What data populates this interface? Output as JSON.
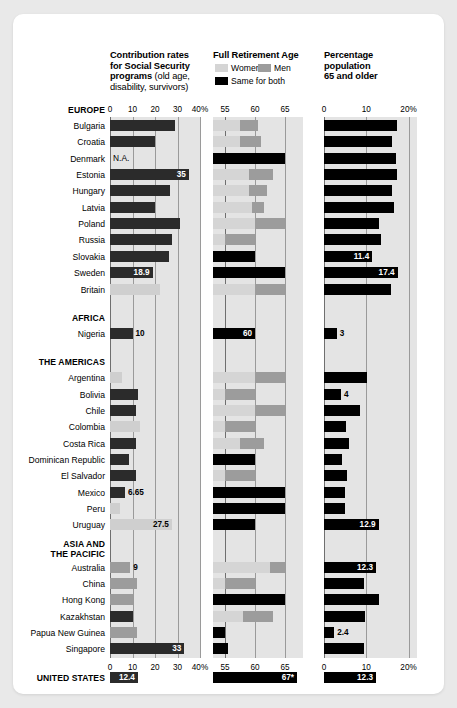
{
  "chart_data": {
    "type": "bar",
    "panels": [
      {
        "key": "contrib",
        "title_bold": "Contribution rates for Social Security programs",
        "title_light": " (old age, disability, survivors)",
        "xlabel": "",
        "ylabel": "",
        "xlim": [
          0,
          40
        ],
        "ticks": [
          "0",
          "10",
          "20",
          "30",
          "40%"
        ],
        "tickvals": [
          0,
          10,
          20,
          30,
          40
        ],
        "grid": true
      },
      {
        "key": "retirement",
        "title_bold": "Full Retirement Age",
        "title_light": "",
        "xlim": [
          53,
          68
        ],
        "ticks": [
          "55",
          "60",
          "65"
        ],
        "tickvals": [
          55,
          60,
          65
        ],
        "grid": true,
        "legend": [
          {
            "name": "Women",
            "color": "#d5d5d5"
          },
          {
            "name": "Men",
            "color": "#9c9c9c"
          },
          {
            "name": "Same for both",
            "color": "#000000"
          }
        ]
      },
      {
        "key": "pop65",
        "title_bold": "Percentage population 65 and older",
        "title_light": "",
        "xlim": [
          0,
          22
        ],
        "ticks": [
          "0",
          "10",
          "20%"
        ],
        "tickvals": [
          0,
          10,
          20
        ],
        "grid": true
      }
    ],
    "regions": [
      {
        "name": "EUROPE",
        "lines": [
          "EUROPE"
        ]
      },
      {
        "name": "AFRICA",
        "lines": [
          "AFRICA"
        ]
      },
      {
        "name": "THE AMERICAS",
        "lines": [
          "THE AMERICAS"
        ]
      },
      {
        "name": "ASIA AND THE PACIFIC",
        "lines": [
          "ASIA AND",
          "THE PACIFIC"
        ]
      },
      {
        "name": "UNITED STATES",
        "lines": [
          "UNITED STATES"
        ]
      }
    ],
    "rows": [
      {
        "label": "Bulgaria",
        "region": "EUROPE",
        "contrib": 29,
        "contrib_label": "",
        "na": false,
        "ret": {
          "mode": "split",
          "women": 57.5,
          "men": 60.5
        },
        "pop65": 17.3,
        "pop65_label": ""
      },
      {
        "label": "Croatia",
        "region": "EUROPE",
        "contrib": 20,
        "contrib_label": "",
        "na": false,
        "ret": {
          "mode": "split",
          "women": 57.5,
          "men": 61.0
        },
        "pop65": 16.0,
        "pop65_label": ""
      },
      {
        "label": "Denmark",
        "region": "EUROPE",
        "contrib": null,
        "contrib_label": "N.A.",
        "na": true,
        "ret": {
          "mode": "both",
          "age": 65.0
        },
        "pop65": 17.0,
        "pop65_label": ""
      },
      {
        "label": "Estonia",
        "region": "EUROPE",
        "contrib": 35,
        "contrib_label": "35",
        "na": false,
        "ret": {
          "mode": "split",
          "women": 59.0,
          "men": 63.0
        },
        "pop65": 17.2,
        "pop65_label": ""
      },
      {
        "label": "Hungary",
        "region": "EUROPE",
        "contrib": 26.5,
        "contrib_label": "",
        "na": false,
        "ret": {
          "mode": "split",
          "women": 59.0,
          "men": 62.0
        },
        "pop65": 16.0,
        "pop65_label": ""
      },
      {
        "label": "Latvia",
        "region": "EUROPE",
        "contrib": 20,
        "contrib_label": "",
        "na": false,
        "ret": {
          "mode": "split",
          "women": 59.5,
          "men": 61.5
        },
        "pop65": 16.6,
        "pop65_label": ""
      },
      {
        "label": "Poland",
        "region": "EUROPE",
        "contrib": 31,
        "contrib_label": "",
        "na": false,
        "ret": {
          "mode": "split",
          "women": 60.0,
          "men": 65.0
        },
        "pop65": 13.0,
        "pop65_label": ""
      },
      {
        "label": "Russia",
        "region": "EUROPE",
        "contrib": 27.5,
        "contrib_label": "",
        "na": false,
        "ret": {
          "mode": "split",
          "women": 55.0,
          "men": 60.0
        },
        "pop65": 13.4,
        "pop65_label": ""
      },
      {
        "label": "Slovakia",
        "region": "EUROPE",
        "contrib": 26,
        "contrib_label": "",
        "na": false,
        "ret": {
          "mode": "both",
          "age": 60.0
        },
        "pop65": 11.4,
        "pop65_label": "11.4"
      },
      {
        "label": "Sweden",
        "region": "EUROPE",
        "contrib": 18.9,
        "contrib_label": "18.9",
        "na": false,
        "ret": {
          "mode": "both",
          "age": 65.0
        },
        "pop65": 17.4,
        "pop65_label": "17.4"
      },
      {
        "label": "Britain",
        "region": "EUROPE",
        "contrib": 22,
        "contrib_label": "",
        "na": false,
        "light": true,
        "ret": {
          "mode": "split",
          "women": 60.0,
          "men": 65.0
        },
        "pop65": 15.8,
        "pop65_label": ""
      },
      {
        "label": "Nigeria",
        "region": "AFRICA",
        "contrib": 10,
        "contrib_label": "10",
        "na": false,
        "ret": {
          "mode": "both",
          "age": 60.0
        },
        "pop65": 3.0,
        "pop65_label": "3"
      },
      {
        "label": "Argentina",
        "region": "THE AMERICAS",
        "contrib": 5.5,
        "contrib_label": "",
        "na": false,
        "light": true,
        "ret": {
          "mode": "split",
          "women": 60.0,
          "men": 65.0
        },
        "pop65": 10.2,
        "pop65_label": ""
      },
      {
        "label": "Bolivia",
        "region": "THE AMERICAS",
        "contrib": 12.5,
        "contrib_label": "",
        "na": false,
        "ret": {
          "mode": "split",
          "women": 55.0,
          "men": 60.0
        },
        "pop65": 4.0,
        "pop65_label": "4"
      },
      {
        "label": "Chile",
        "region": "THE AMERICAS",
        "contrib": 11.5,
        "contrib_label": "",
        "na": false,
        "ret": {
          "mode": "split",
          "women": 60.0,
          "men": 65.0
        },
        "pop65": 8.5,
        "pop65_label": ""
      },
      {
        "label": "Colombia",
        "region": "THE AMERICAS",
        "contrib": 13.5,
        "contrib_label": "",
        "na": false,
        "light": true,
        "ret": {
          "mode": "split",
          "women": 55.0,
          "men": 60.0
        },
        "pop65": 5.2,
        "pop65_label": ""
      },
      {
        "label": "Costa Rica",
        "region": "THE AMERICAS",
        "contrib": 11.5,
        "contrib_label": "",
        "na": false,
        "ret": {
          "mode": "split",
          "women": 57.5,
          "men": 61.5
        },
        "pop65": 5.8,
        "pop65_label": ""
      },
      {
        "label": "Dominican Republic",
        "region": "THE AMERICAS",
        "contrib": 8.5,
        "contrib_label": "",
        "na": false,
        "ret": {
          "mode": "both",
          "age": 60.0
        },
        "pop65": 4.3,
        "pop65_label": ""
      },
      {
        "label": "El Salvador",
        "region": "THE AMERICAS",
        "contrib": 11.5,
        "contrib_label": "",
        "na": false,
        "ret": {
          "mode": "split",
          "women": 55.0,
          "men": 60.0
        },
        "pop65": 5.5,
        "pop65_label": ""
      },
      {
        "label": "Mexico",
        "region": "THE AMERICAS",
        "contrib": 6.65,
        "contrib_label": "6.65",
        "na": false,
        "ret": {
          "mode": "both",
          "age": 65.0
        },
        "pop65": 5.0,
        "pop65_label": ""
      },
      {
        "label": "Peru",
        "region": "THE AMERICAS",
        "contrib": 4.5,
        "contrib_label": "",
        "na": false,
        "light": true,
        "ret": {
          "mode": "both",
          "age": 65.0
        },
        "pop65": 5.0,
        "pop65_label": ""
      },
      {
        "label": "Uruguay",
        "region": "THE AMERICAS",
        "contrib": 27.5,
        "contrib_label": "27.5",
        "na": false,
        "light": true,
        "ret": {
          "mode": "both",
          "age": 60.0
        },
        "pop65": 12.9,
        "pop65_label": "12.9"
      },
      {
        "label": "Australia",
        "region": "ASIA AND THE PACIFIC",
        "contrib": 9,
        "contrib_label": "9",
        "na": false,
        "men_style": true,
        "ret": {
          "mode": "split",
          "women": 62.5,
          "men": 65.0
        },
        "pop65": 12.3,
        "pop65_label": "12.3"
      },
      {
        "label": "China",
        "region": "ASIA AND THE PACIFIC",
        "contrib": 12,
        "contrib_label": "",
        "na": false,
        "men_style": true,
        "ret": {
          "mode": "split",
          "women": 55.0,
          "men": 60.0
        },
        "pop65": 9.5,
        "pop65_label": ""
      },
      {
        "label": "Hong Kong",
        "region": "ASIA AND THE PACIFIC",
        "contrib": 10,
        "contrib_label": "",
        "na": false,
        "men_style": true,
        "ret": {
          "mode": "both",
          "age": 65.0
        },
        "pop65": 13.0,
        "pop65_label": ""
      },
      {
        "label": "Kazakhstan",
        "region": "ASIA AND THE PACIFIC",
        "contrib": 10,
        "contrib_label": "",
        "na": false,
        "ret": {
          "mode": "split",
          "women": 58.0,
          "men": 63.0
        },
        "pop65": 9.6,
        "pop65_label": ""
      },
      {
        "label": "Papua New Guinea",
        "region": "ASIA AND THE PACIFIC",
        "contrib": 12,
        "contrib_label": "",
        "na": false,
        "men_style": true,
        "ret": {
          "mode": "both",
          "age": 55.0
        },
        "pop65": 2.4,
        "pop65_label": "2.4"
      },
      {
        "label": "Singapore",
        "region": "ASIA AND THE PACIFIC",
        "contrib": 33,
        "contrib_label": "33",
        "na": false,
        "ret": {
          "mode": "both",
          "age": 55.5
        },
        "pop65": 9.5,
        "pop65_label": ""
      },
      {
        "label": "UNITED STATES",
        "region": "UNITED STATES",
        "contrib": 12.4,
        "contrib_label": "12.4",
        "na": false,
        "is_total": true,
        "ret": {
          "mode": "both",
          "age": 67.0,
          "label": "67*"
        },
        "pop65": 12.3,
        "pop65_label": "12.3"
      }
    ]
  }
}
